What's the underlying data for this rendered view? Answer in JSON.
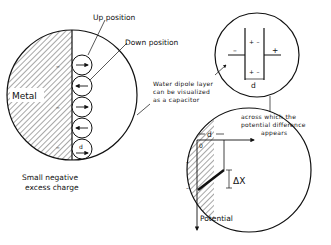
{
  "diagram": {
    "left_circle": {
      "metal_label": "Metal",
      "up_position_label": "Up position",
      "down_position_label": "Down position",
      "negative_signs": [
        "–",
        "–",
        "–"
      ],
      "dipoles": [
        {
          "direction": "right"
        },
        {
          "direction": "left"
        },
        {
          "direction": "right"
        },
        {
          "direction": "left"
        },
        {
          "direction": "right",
          "label": "d"
        }
      ],
      "caption_line1": "Small negative",
      "caption_line2": "excess charge"
    },
    "middle_note": {
      "line1": "Water dipole layer",
      "line2": "can be visualized",
      "line3": "as a capacitor"
    },
    "capacitor_circle": {
      "left_sign": "–",
      "right_sign": "+",
      "top_inner": "+ –",
      "bottom_inner": "+ –",
      "gap_label": "d"
    },
    "right_note": {
      "line1": "across which the",
      "line2": "potential difference",
      "line3": "appears"
    },
    "potential_circle": {
      "origin_label": "0",
      "d_label": "d",
      "delta_label": "ΔX",
      "axis_label": "Potential",
      "negative_signs": [
        "–",
        "–"
      ]
    },
    "colors": {
      "ink": "#111111",
      "background": "#ffffff"
    }
  }
}
